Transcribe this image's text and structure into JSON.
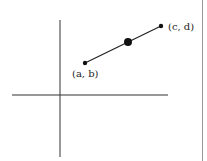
{
  "diagram": {
    "points": [
      {
        "id": "start",
        "label": "(a, b)",
        "x": 85,
        "y": 63,
        "r": 2.2
      },
      {
        "id": "midpoint",
        "label": "",
        "x": 128,
        "y": 42,
        "r": 4
      },
      {
        "id": "end",
        "label": "(c, d)",
        "x": 161,
        "y": 26,
        "r": 2.2
      }
    ],
    "axes": {
      "origin": {
        "x": 60,
        "y": 95
      },
      "x_axis": {
        "x1": 12,
        "x2": 168
      },
      "y_axis": {
        "y1": 20,
        "y2": 157
      }
    },
    "colors": {
      "line": "#222222",
      "border": "#888888"
    }
  }
}
